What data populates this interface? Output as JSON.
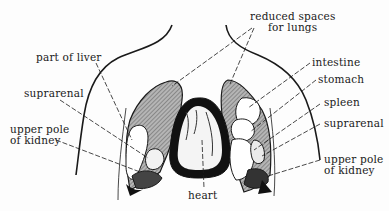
{
  "diagram": {
    "labels": {
      "part_of_liver": "part of liver",
      "reduced_spaces_line1": "reduced spaces",
      "reduced_spaces_line2": "for lungs",
      "intestine": "intestine",
      "stomach": "stomach",
      "spleen": "spleen",
      "suprarenal_left": "suprarenal",
      "suprarenal_right": "suprarenal",
      "upper_pole_left_line1": "upper pole",
      "upper_pole_left_line2": "of kidney",
      "upper_pole_right_line1": "upper pole",
      "upper_pole_right_line2": "of kidney",
      "heart": "heart"
    },
    "colors": {
      "ink": "#1a1a1a",
      "lung_space_fill": "#9a9a9a",
      "background": "#fdfdfd"
    }
  }
}
